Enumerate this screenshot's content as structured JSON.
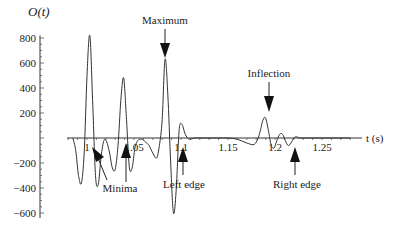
{
  "chart_data": {
    "type": "line",
    "title": "",
    "xlabel": "t (s)",
    "ylabel": "O(t)",
    "xlim": [
      0.99,
      1.29
    ],
    "ylim": [
      -650,
      850
    ],
    "grid": false,
    "x_ticks": [
      1,
      1.05,
      1.1,
      1.15,
      1.2,
      1.25
    ],
    "x_tick_labels": [
      "1",
      "1.05",
      "1.1",
      "1.15",
      "1.2",
      "1.25"
    ],
    "y_ticks": [
      800,
      600,
      400,
      200,
      -200,
      -400,
      -600
    ],
    "y_tick_labels": [
      "800",
      "600",
      "400",
      "200",
      "-200",
      "-400",
      "-600"
    ],
    "series": [
      {
        "name": "O(t)",
        "x": [
          0.985,
          0.988,
          0.991,
          0.994,
          0.997,
          1.0,
          1.003,
          1.006,
          1.009,
          1.012,
          1.015,
          1.018,
          1.021,
          1.024,
          1.027,
          1.03,
          1.033,
          1.036,
          1.039,
          1.042,
          1.045,
          1.048,
          1.051,
          1.054,
          1.058,
          1.062,
          1.066,
          1.07,
          1.074,
          1.077,
          1.08,
          1.083,
          1.086,
          1.089,
          1.092,
          1.095,
          1.098,
          1.101,
          1.104,
          1.107,
          1.11,
          1.114,
          1.12,
          1.13,
          1.14,
          1.15,
          1.16,
          1.17,
          1.178,
          1.183,
          1.187,
          1.19,
          1.193,
          1.196,
          1.199,
          1.202,
          1.205,
          1.208,
          1.211,
          1.214,
          1.217,
          1.22,
          1.223,
          1.226,
          1.23,
          1.24,
          1.25,
          1.26,
          1.27,
          1.28
        ],
        "y": [
          0,
          -100,
          -300,
          -360,
          -120,
          500,
          820,
          300,
          -300,
          -370,
          -150,
          -20,
          -30,
          -120,
          -240,
          -250,
          -60,
          300,
          480,
          150,
          -230,
          -240,
          -80,
          -20,
          -10,
          -30,
          -60,
          -120,
          -160,
          -60,
          150,
          630,
          350,
          -200,
          -600,
          -400,
          60,
          110,
          40,
          0,
          -10,
          0,
          0,
          0,
          0,
          0,
          -10,
          -40,
          -50,
          20,
          140,
          160,
          60,
          -60,
          -80,
          -20,
          30,
          30,
          -20,
          -60,
          -40,
          0,
          10,
          0,
          0,
          0,
          0,
          0,
          0,
          0
        ]
      }
    ],
    "annotations": [
      {
        "text": "Maximum",
        "x": 1.083,
        "y": 630,
        "arrow": "down"
      },
      {
        "text": "Minima",
        "x": 1.012,
        "y": -100,
        "arrow": "up-diagonal"
      },
      {
        "text": "Minima",
        "x": 1.042,
        "y": -100,
        "arrow": "up"
      },
      {
        "text": "Left edge",
        "x": 1.1,
        "y": -60,
        "arrow": "up"
      },
      {
        "text": "Inflection",
        "x": 1.19,
        "y": 160,
        "arrow": "down"
      },
      {
        "text": "Right edge",
        "x": 1.22,
        "y": -60,
        "arrow": "up"
      }
    ]
  },
  "labels": {
    "ylabel": "O(t)",
    "xlabel": "t (s)",
    "maximum": "Maximum",
    "minima": "Minima",
    "left_edge": "Left edge",
    "inflection": "Inflection",
    "right_edge": "Right edge"
  }
}
